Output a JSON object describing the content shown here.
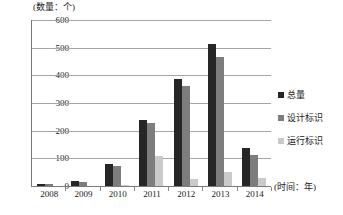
{
  "chart_data": {
    "type": "bar",
    "title": "",
    "xlabel": "(时间：年)",
    "ylabel": "(数量：个)",
    "categories": [
      "2008",
      "2009",
      "2010",
      "2011",
      "2012",
      "2013",
      "2014"
    ],
    "series": [
      {
        "name": "总量",
        "color": "#262626",
        "values": [
          8,
          18,
          80,
          238,
          387,
          515,
          138
        ]
      },
      {
        "name": "设计标识",
        "color": "#7d7d7d",
        "values": [
          8,
          16,
          72,
          226,
          362,
          465,
          112
        ]
      },
      {
        "name": "运行标识",
        "color": "#cacaca",
        "values": [
          0,
          0,
          3,
          110,
          25,
          50,
          28
        ]
      }
    ],
    "ylim": [
      0,
      600
    ],
    "yticks": [
      600,
      500,
      400,
      300,
      200,
      100,
      0
    ],
    "grid": true,
    "legend_position": "right"
  },
  "legend": {
    "items": [
      {
        "label": "总量"
      },
      {
        "label": "设计标识"
      },
      {
        "label": "运行标识"
      }
    ]
  },
  "caption": {
    "text": ""
  }
}
